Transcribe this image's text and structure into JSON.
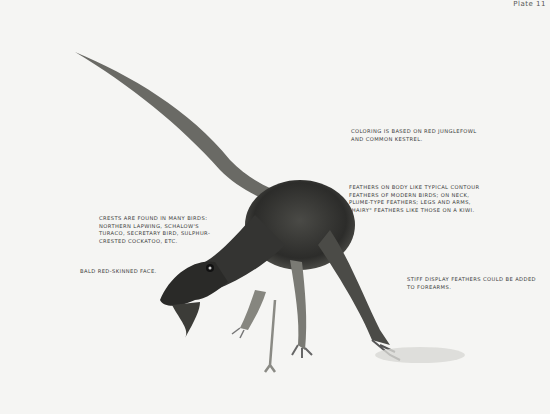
{
  "plate": {
    "label": "Plate 11"
  },
  "illustration": {
    "subject": "feathered theropod dinosaur (dromaeosaur) reconstruction",
    "colors": {
      "background": "#f5f5f3",
      "body_dark": "#2e2e2c",
      "body_mid": "#6b6b66",
      "legs": "#8a8a84"
    }
  },
  "annotations": {
    "coloring": "Coloring is based on red junglefowl\nand common kestrel.",
    "feathers": "Feathers on body like typical contour\nfeathers of modern birds; on neck,\nplume-type feathers; legs and arms,\n\"hairy\" feathers like those on a kiwi.",
    "crests": "Crests are found in many birds:\nnorthern lapwing, Schalow's\nturaco, secretary bird, sulphur-\ncrested cockatoo, etc.",
    "face": "Bald red-skinned face.",
    "display": "Stiff display feathers could be added\nto forearms."
  }
}
